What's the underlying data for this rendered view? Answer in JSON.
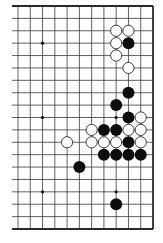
{
  "diagram": {
    "type": "go-board-fragment",
    "visible_columns": 12,
    "visible_rows": 19,
    "edges": {
      "top": true,
      "right": true,
      "bottom": true,
      "left": false
    },
    "geometry": {
      "x0": 18,
      "y0": 6,
      "x_end": 153,
      "y_end": 229,
      "left_overhang": 6,
      "stone_radius": 5.6
    },
    "colors": {
      "line": "#3a3a3a",
      "edge": "#2a2a2a",
      "black_stone": "#0d0d0d",
      "white_stone": "#ffffff",
      "white_outline": "#2a2a2a",
      "background": "#ffffff"
    },
    "star_points": [
      [
        2,
        3
      ],
      [
        8,
        3
      ],
      [
        2,
        9
      ],
      [
        8,
        9
      ],
      [
        2,
        15
      ],
      [
        8,
        15
      ]
    ],
    "white_stones": [
      [
        8,
        2
      ],
      [
        9,
        2
      ],
      [
        8,
        3
      ],
      [
        8,
        4
      ],
      [
        9,
        5
      ],
      [
        10,
        9
      ],
      [
        6,
        10
      ],
      [
        9,
        10
      ],
      [
        10,
        10
      ],
      [
        4,
        11
      ],
      [
        6,
        11
      ],
      [
        7,
        11
      ],
      [
        8,
        11
      ],
      [
        10,
        11
      ]
    ],
    "black_stones": [
      [
        9,
        3
      ],
      [
        9,
        7
      ],
      [
        8,
        8
      ],
      [
        9,
        9
      ],
      [
        7,
        10
      ],
      [
        8,
        10
      ],
      [
        9,
        11
      ],
      [
        7,
        12
      ],
      [
        8,
        12
      ],
      [
        9,
        12
      ],
      [
        10,
        12
      ],
      [
        5,
        13
      ],
      [
        8,
        16
      ]
    ]
  }
}
